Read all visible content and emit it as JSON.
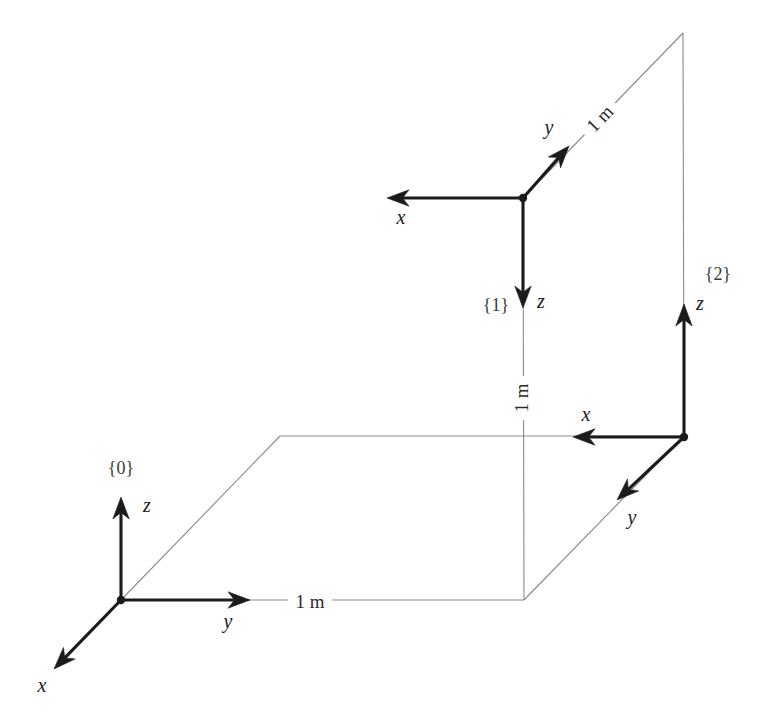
{
  "figure": {
    "type": "technical-line-diagram",
    "canvas": {
      "width": 769,
      "height": 725
    },
    "colors": {
      "background": "#ffffff",
      "axis_stroke": "#1b1b1b",
      "construction_stroke": "#8a8a8a",
      "label_text": "#1b1b1b",
      "frame_text": "#3b3b3b"
    }
  },
  "frames": [
    {
      "id": "frame-0",
      "name": "{0}",
      "name_x": 121,
      "name_y": 474,
      "origin": {
        "x": 121,
        "y": 600
      },
      "axes": [
        {
          "id": "axis-0-z",
          "label": "z",
          "tip": {
            "x": 121,
            "y": 497
          },
          "label_x": 147,
          "label_y": 512
        },
        {
          "id": "axis-0-y",
          "label": "y",
          "tip": {
            "x": 250,
            "y": 600
          },
          "label_x": 228,
          "label_y": 628
        },
        {
          "id": "axis-0-x",
          "label": "x",
          "tip": {
            "x": 54,
            "y": 669
          },
          "label_x": 42,
          "label_y": 692
        }
      ]
    },
    {
      "id": "frame-1",
      "name": "{1}",
      "name_x": 496,
      "name_y": 311,
      "origin": {
        "x": 523,
        "y": 198
      },
      "axes": [
        {
          "id": "axis-1-x",
          "label": "x",
          "tip": {
            "x": 387,
            "y": 198
          },
          "label_x": 401,
          "label_y": 224
        },
        {
          "id": "axis-1-y",
          "label": "y",
          "tip": {
            "x": 569,
            "y": 146
          },
          "label_x": 549,
          "label_y": 134
        },
        {
          "id": "axis-1-z",
          "label": "z",
          "tip": {
            "x": 523,
            "y": 308
          },
          "label_x": 541,
          "label_y": 308
        }
      ]
    },
    {
      "id": "frame-2",
      "name": "{2}",
      "name_x": 718,
      "name_y": 280,
      "origin": {
        "x": 684,
        "y": 437
      },
      "axes": [
        {
          "id": "axis-2-z",
          "label": "z",
          "tip": {
            "x": 684,
            "y": 304
          },
          "label_x": 700,
          "label_y": 310
        },
        {
          "id": "axis-2-x",
          "label": "x",
          "tip": {
            "x": 573,
            "y": 437
          },
          "label_x": 586,
          "label_y": 421
        },
        {
          "id": "axis-2-y",
          "label": "y",
          "tip": {
            "x": 617,
            "y": 500
          },
          "label_x": 632,
          "label_y": 524
        }
      ]
    }
  ],
  "construction_lines": [
    {
      "id": "ground-plane-near-edge",
      "from": {
        "x": 121,
        "y": 600
      },
      "to": {
        "x": 524,
        "y": 600
      }
    },
    {
      "id": "ground-plane-left-edge",
      "from": {
        "x": 121,
        "y": 600
      },
      "to": {
        "x": 280,
        "y": 436
      }
    },
    {
      "id": "ground-plane-far-edge",
      "from": {
        "x": 280,
        "y": 436
      },
      "to": {
        "x": 684,
        "y": 436
      }
    },
    {
      "id": "ground-plane-right-edge",
      "from": {
        "x": 524,
        "y": 600
      },
      "to": {
        "x": 684,
        "y": 436
      }
    },
    {
      "id": "vertical-post-frame1",
      "from": {
        "x": 523,
        "y": 198
      },
      "to": {
        "x": 524,
        "y": 600
      }
    },
    {
      "id": "vertical-post-frame2",
      "from": {
        "x": 683,
        "y": 33
      },
      "to": {
        "x": 684,
        "y": 437
      }
    },
    {
      "id": "diagonal-frame1-to-top",
      "from": {
        "x": 523,
        "y": 198
      },
      "to": {
        "x": 683,
        "y": 33
      }
    }
  ],
  "dimensions": [
    {
      "id": "dim-ground-1m",
      "label": "1 m",
      "x": 310,
      "y": 602,
      "rotation": 0,
      "description": "horizontal span along frame 0 y-axis"
    },
    {
      "id": "dim-vertical-1m",
      "label": "1 m",
      "x": 522,
      "y": 398,
      "rotation": -90,
      "description": "vertical span from ground plane up to frame 1"
    },
    {
      "id": "dim-diagonal-1m",
      "label": "1 m",
      "x": 600,
      "y": 119,
      "rotation": -46,
      "description": "diagonal span along frame 1 y-axis"
    }
  ]
}
